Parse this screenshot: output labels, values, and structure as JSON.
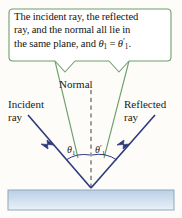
{
  "figure": {
    "background_color": "#fdfcf8",
    "callout": {
      "border_color": "#6d9e6d",
      "fill_color": "#ffffff",
      "line1": "The incident ray, the reflected",
      "line2": "ray, and the normal all lie in",
      "line3_prefix": "the same plane, and ",
      "theta_left": "θ",
      "theta_left_sub": "1",
      "equals": " = ",
      "theta_right": "θ",
      "theta_right_prime": "′",
      "theta_right_sub": "1",
      "line3_suffix": "."
    },
    "labels": {
      "normal": "Normal",
      "incident_line1": "Incident",
      "incident_line2": "ray",
      "reflected_line1": "Reflected",
      "reflected_line2": "ray",
      "angle_incidence_symbol": "θ",
      "angle_incidence_sub": "1",
      "angle_reflection_symbol": "θ",
      "angle_reflection_prime": "′",
      "angle_reflection_sub": "1"
    },
    "colors": {
      "ray": "#2c3a7b",
      "callout_border": "#6d9e6d",
      "normal_dash": "#6b6b6b",
      "surface_fill_top": "#c2d6ea",
      "surface_fill_bottom": "#e8eff7",
      "surface_border": "#8fa8be",
      "arc": "#2c3a7b"
    },
    "geometry": {
      "vertex_x": 91,
      "vertex_y": 188,
      "normal_top_y": 90,
      "normal_bottom_y": 190,
      "surface_x": 8,
      "surface_y": 190,
      "surface_width": 166,
      "surface_height": 20
    }
  }
}
